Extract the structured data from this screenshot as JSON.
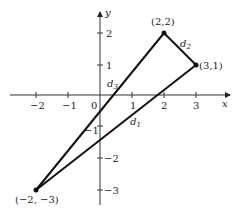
{
  "figure": {
    "axes": {
      "x_label": "x",
      "y_label": "y",
      "x_ticks": [
        {
          "value": -2,
          "label": "−2"
        },
        {
          "value": -1,
          "label": "−1"
        },
        {
          "value": 0,
          "label": "0"
        },
        {
          "value": 1,
          "label": "1"
        },
        {
          "value": 2,
          "label": "2"
        },
        {
          "value": 3,
          "label": "3"
        }
      ],
      "y_ticks": [
        {
          "value": 2,
          "label": "2"
        },
        {
          "value": 1,
          "label": "1"
        },
        {
          "value": -1,
          "label": "−1"
        },
        {
          "value": -2,
          "label": "−2"
        },
        {
          "value": -3,
          "label": "−3"
        }
      ]
    },
    "points": [
      {
        "label": "(2,2)",
        "x": 2,
        "y": 2
      },
      {
        "label": "(3,1)",
        "x": 3,
        "y": 1
      },
      {
        "label": "(−2, −3)",
        "x": -2,
        "y": -3
      }
    ],
    "segments": [
      {
        "label": "d1",
        "from": "(−2, −3)",
        "to": "(3,1)"
      },
      {
        "label": "d2",
        "from": "(2,2)",
        "to": "(3,1)"
      },
      {
        "label": "d3",
        "from": "(−2, −3)",
        "to": "(2,2)"
      }
    ],
    "segment_labels": {
      "d1": "d",
      "d1_sub": "1",
      "d2": "d",
      "d2_sub": "2",
      "d3": "d",
      "d3_sub": "3"
    }
  }
}
